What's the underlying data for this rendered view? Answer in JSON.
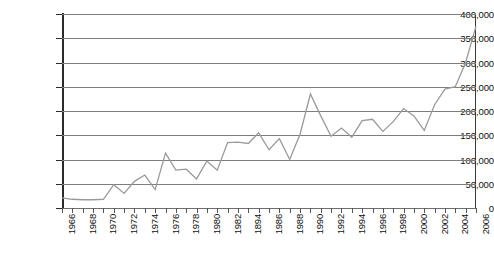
{
  "chart_data": {
    "type": "line",
    "title": "",
    "subtitle": "",
    "xlabel": "",
    "ylabel": "",
    "grid": true,
    "legend": "none",
    "xlim": [
      1966,
      2006
    ],
    "ylim": [
      0,
      400000
    ],
    "ytick_labels": [
      "400,000",
      "350,000",
      "300,000",
      "250,000",
      "200,000",
      "150,000",
      "100,000",
      "50,000",
      "0"
    ],
    "ytick_values": [
      400000,
      350000,
      300000,
      250000,
      200000,
      150000,
      100000,
      50000,
      0
    ],
    "xtick_labels": [
      "1966",
      "1968",
      "1970",
      "1972",
      "1974",
      "1976",
      "1978",
      "1980",
      "1982",
      "1894",
      "1986",
      "1988",
      "1990",
      "1992",
      "1994",
      "1996",
      "1998",
      "2000",
      "2002",
      "2004",
      "2006"
    ],
    "xtick_label_years": [
      1966,
      1968,
      1970,
      1972,
      1974,
      1976,
      1978,
      1980,
      1982,
      1984,
      1986,
      1988,
      1990,
      1992,
      1994,
      1996,
      1998,
      2000,
      2002,
      2004,
      2006
    ],
    "x": [
      1966,
      1967,
      1968,
      1969,
      1970,
      1971,
      1972,
      1973,
      1974,
      1975,
      1976,
      1977,
      1978,
      1979,
      1980,
      1981,
      1982,
      1983,
      1984,
      1985,
      1986,
      1987,
      1988,
      1989,
      1990,
      1991,
      1992,
      1993,
      1994,
      1995,
      1996,
      1997,
      1998,
      1999,
      2000,
      2001,
      2002,
      2003,
      2004,
      2005,
      2006
    ],
    "series": [
      {
        "name": "",
        "color": "#9a9a9a",
        "values": [
          21000,
          18000,
          17000,
          17000,
          18000,
          48000,
          30000,
          55000,
          68000,
          38000,
          113000,
          78000,
          80000,
          60000,
          97000,
          78000,
          135000,
          136000,
          133000,
          155000,
          120000,
          143000,
          100000,
          152000,
          235000,
          190000,
          148000,
          165000,
          146000,
          180000,
          183000,
          158000,
          178000,
          205000,
          190000,
          160000,
          213000,
          245000,
          250000,
          300000,
          375000
        ]
      }
    ]
  }
}
